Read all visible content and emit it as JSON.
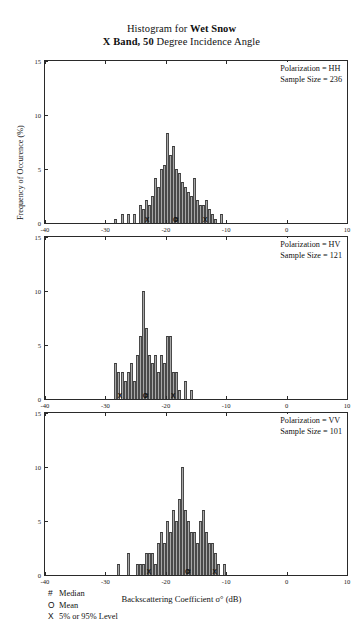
{
  "figure": {
    "title_line1_prefix": "Histogram for ",
    "title_line1_bold": "Wet Snow",
    "title_line2_bold": "X Band, 50",
    "title_line2_rest": " Degree Incidence Angle",
    "xaxis_title": "Backscattering Coefficient  σ° (dB)",
    "yaxis_title": "Frequency of Occurence (%)"
  },
  "key": {
    "items": [
      {
        "symbol": "#",
        "label": "Median"
      },
      {
        "symbol": "O",
        "label": "Mean"
      },
      {
        "symbol": "X",
        "label": "5% or 95% Level"
      }
    ]
  },
  "axes": {
    "x_ticks": [
      -40,
      -30,
      -20,
      -10,
      0,
      10
    ],
    "x_tick_labels": [
      "-40",
      "-30",
      "-20",
      "-10",
      "0",
      "10"
    ],
    "xlim": [
      -40,
      10
    ],
    "y_ticks": [
      0,
      5,
      10,
      15
    ],
    "y_tick_labels": [
      "0",
      "5",
      "10",
      "15"
    ],
    "ylim": [
      0,
      15
    ]
  },
  "chart_data": {
    "type": "bar",
    "xlabel": "Backscattering Coefficient σ° (dB)",
    "ylabel": "Frequency of Occurence (%)",
    "xlim": [
      -40,
      10
    ],
    "ylim": [
      0,
      15
    ],
    "grid": false,
    "bin_width": 0.5,
    "panels": [
      {
        "id": "panel-hh",
        "polarization_label": "Polarization = HH",
        "sample_size_label": "Sample Size =   236",
        "polarization": "HH",
        "sample_size": 236,
        "markers": [
          {
            "symbol": "X",
            "name": "5% Level",
            "x": -23.1
          },
          {
            "symbol": "O",
            "name": "Mean",
            "x": -18.4
          },
          {
            "symbol": "#",
            "name": "Median",
            "x": -18.2
          },
          {
            "symbol": "X",
            "name": "95% Level",
            "x": -13.5
          }
        ],
        "bins": [
          -28.5,
          -28.0,
          -27.5,
          -27.0,
          -26.5,
          -26.0,
          -25.5,
          -25.0,
          -24.5,
          -24.0,
          -23.5,
          -23.0,
          -22.5,
          -22.0,
          -21.5,
          -21.0,
          -20.5,
          -20.0,
          -19.5,
          -19.0,
          -18.5,
          -18.0,
          -17.5,
          -17.0,
          -16.5,
          -16.0,
          -15.5,
          -15.0,
          -14.5,
          -14.0,
          -13.5,
          -13.0,
          -12.5,
          -12.0,
          -11.5,
          -11.0
        ],
        "values": [
          0.4,
          0.0,
          0.8,
          0.0,
          0.8,
          0.0,
          0.8,
          0.0,
          1.7,
          1.3,
          2.1,
          1.7,
          2.5,
          4.2,
          3.3,
          5.0,
          5.4,
          8.3,
          6.3,
          7.1,
          5.0,
          4.6,
          3.8,
          3.3,
          2.9,
          2.5,
          4.2,
          2.1,
          1.7,
          1.7,
          2.1,
          1.3,
          0.8,
          0.4,
          0.0,
          0.8
        ]
      },
      {
        "id": "panel-hv",
        "polarization_label": "Polarization = HV",
        "sample_size_label": "Sample Size =   121",
        "polarization": "HV",
        "sample_size": 121,
        "markers": [
          {
            "symbol": "X",
            "name": "5% Level",
            "x": -27.6
          },
          {
            "symbol": "O",
            "name": "Mean",
            "x": -23.4
          },
          {
            "symbol": "#",
            "name": "Median",
            "x": -23.2
          },
          {
            "symbol": "X",
            "name": "95% Level",
            "x": -18.8
          }
        ],
        "bins": [
          -28.5,
          -28.0,
          -27.5,
          -27.0,
          -26.5,
          -26.0,
          -25.5,
          -25.0,
          -24.5,
          -24.0,
          -23.5,
          -23.0,
          -22.5,
          -22.0,
          -21.5,
          -21.0,
          -20.5,
          -20.0,
          -19.5,
          -19.0,
          -18.5,
          -18.0,
          -17.5,
          -17.0,
          -16.5,
          -16.0
        ],
        "values": [
          3.3,
          2.5,
          2.5,
          1.7,
          2.5,
          3.3,
          1.7,
          4.1,
          5.8,
          10.0,
          6.6,
          4.1,
          3.3,
          4.1,
          2.5,
          4.1,
          3.3,
          5.8,
          5.8,
          2.5,
          2.5,
          0.8,
          0.0,
          1.7,
          0.0,
          0.8
        ]
      },
      {
        "id": "panel-vv",
        "polarization_label": "Polarization = VV",
        "sample_size_label": "Sample Size =   101",
        "polarization": "VV",
        "sample_size": 101,
        "markers": [
          {
            "symbol": "X",
            "name": "5% Level",
            "x": -22.8
          },
          {
            "symbol": "O",
            "name": "Mean",
            "x": -16.4
          },
          {
            "symbol": "#",
            "name": "Median",
            "x": -16.2
          },
          {
            "symbol": "X",
            "name": "95% Level",
            "x": -11.9
          }
        ],
        "bins": [
          -28.5,
          -28.0,
          -27.5,
          -27.0,
          -26.5,
          -26.0,
          -25.5,
          -25.0,
          -24.5,
          -24.0,
          -23.5,
          -23.0,
          -22.5,
          -22.0,
          -21.5,
          -21.0,
          -20.5,
          -20.0,
          -19.5,
          -19.0,
          -18.5,
          -18.0,
          -17.5,
          -17.0,
          -16.5,
          -16.0,
          -15.5,
          -15.0,
          -14.5,
          -14.0,
          -13.5,
          -13.0,
          -12.5,
          -12.0,
          -11.5,
          -11.0,
          -10.5
        ],
        "values": [
          0.0,
          1.0,
          0.0,
          0.0,
          2.0,
          0.0,
          0.0,
          1.0,
          1.0,
          1.0,
          2.0,
          2.0,
          2.0,
          1.0,
          3.0,
          4.0,
          3.0,
          5.0,
          4.0,
          6.0,
          5.0,
          7.0,
          10.0,
          6.0,
          5.0,
          4.0,
          4.0,
          3.0,
          5.0,
          6.0,
          4.0,
          3.0,
          3.0,
          2.0,
          1.0,
          0.0,
          1.0
        ]
      }
    ]
  }
}
